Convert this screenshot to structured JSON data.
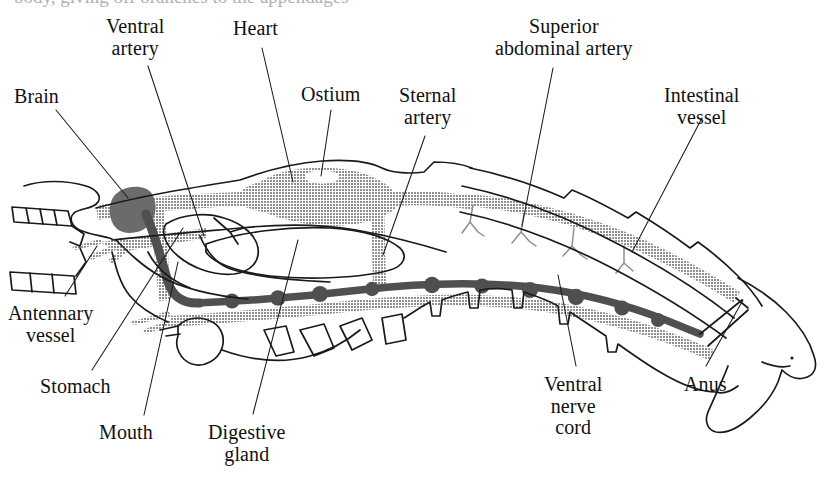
{
  "figure": {
    "top_cropped_text": "body, giving off branches to the appendages",
    "colors": {
      "outline": "#1a1a1a",
      "artery_gray": "#999999",
      "nerve_dark": "#555555",
      "brain_dark": "#6b6b6b",
      "background": "#ffffff",
      "label_text": "#111111"
    }
  },
  "labels": [
    {
      "id": "brain",
      "text": "Brain",
      "lines": [
        "Brain"
      ],
      "x": 14,
      "y": 86,
      "align": "left"
    },
    {
      "id": "ventral-artery",
      "text": "Ventral artery",
      "lines": [
        "Ventral",
        "artery"
      ],
      "x": 106,
      "y": 16,
      "align": "center"
    },
    {
      "id": "heart",
      "text": "Heart",
      "lines": [
        "Heart"
      ],
      "x": 233,
      "y": 18,
      "align": "center"
    },
    {
      "id": "ostium",
      "text": "Ostium",
      "lines": [
        "Ostium"
      ],
      "x": 301,
      "y": 84,
      "align": "center"
    },
    {
      "id": "sternal-artery",
      "text": "Sternal artery",
      "lines": [
        "Sternal",
        "artery"
      ],
      "x": 399,
      "y": 85,
      "align": "center"
    },
    {
      "id": "superior-abdominal-artery",
      "text": "Superior abdominal artery",
      "lines": [
        "Superior",
        "abdominal artery"
      ],
      "x": 495,
      "y": 16,
      "align": "center"
    },
    {
      "id": "intestinal-vessel",
      "text": "Intestinal vessel",
      "lines": [
        "Intestinal",
        "vessel"
      ],
      "x": 664,
      "y": 85,
      "align": "center"
    },
    {
      "id": "antennary-vessel",
      "text": "Antennary vessel",
      "lines": [
        "Antennary",
        "vessel"
      ],
      "x": 8,
      "y": 303,
      "align": "center"
    },
    {
      "id": "stomach",
      "text": "Stomach",
      "lines": [
        "Stomach"
      ],
      "x": 40,
      "y": 376,
      "align": "left"
    },
    {
      "id": "mouth",
      "text": "Mouth",
      "lines": [
        "Mouth"
      ],
      "x": 99,
      "y": 422,
      "align": "left"
    },
    {
      "id": "digestive-gland",
      "text": "Digestive gland",
      "lines": [
        "Digestive",
        "gland"
      ],
      "x": 208,
      "y": 422,
      "align": "center"
    },
    {
      "id": "ventral-nerve-cord",
      "text": "Ventral nerve cord",
      "lines": [
        "Ventral",
        "nerve",
        "cord"
      ],
      "x": 544,
      "y": 374,
      "align": "center"
    },
    {
      "id": "anus",
      "text": "Anus",
      "lines": [
        "Anus"
      ],
      "x": 684,
      "y": 374,
      "align": "left"
    }
  ],
  "leader_lines": [
    {
      "id": "brain",
      "x1": 56,
      "y1": 110,
      "x2": 128,
      "y2": 198
    },
    {
      "id": "ventral-artery",
      "x1": 148,
      "y1": 66,
      "x2": 204,
      "y2": 236
    },
    {
      "id": "heart",
      "x1": 262,
      "y1": 48,
      "x2": 293,
      "y2": 182
    },
    {
      "id": "ostium",
      "x1": 331,
      "y1": 110,
      "x2": 321,
      "y2": 176
    },
    {
      "id": "sternal-artery",
      "x1": 425,
      "y1": 136,
      "x2": 383,
      "y2": 255
    },
    {
      "id": "superior-abdominal-artery",
      "x1": 553,
      "y1": 68,
      "x2": 522,
      "y2": 226
    },
    {
      "id": "intestinal-vessel",
      "x1": 702,
      "y1": 118,
      "x2": 632,
      "y2": 252
    },
    {
      "id": "antennary-vessel",
      "x1": 65,
      "y1": 296,
      "x2": 97,
      "y2": 246
    },
    {
      "id": "stomach",
      "x1": 92,
      "y1": 370,
      "x2": 183,
      "y2": 228
    },
    {
      "id": "mouth",
      "x1": 144,
      "y1": 415,
      "x2": 178,
      "y2": 262
    },
    {
      "id": "digestive-gland",
      "x1": 253,
      "y1": 414,
      "x2": 298,
      "y2": 240
    },
    {
      "id": "ventral-nerve-cord",
      "x1": 576,
      "y1": 366,
      "x2": 558,
      "y2": 275
    },
    {
      "id": "anus",
      "x1": 706,
      "y1": 366,
      "x2": 743,
      "y2": 300
    }
  ],
  "structures": [
    {
      "id": "body-outline",
      "name": "Body outline",
      "style": "stroke"
    },
    {
      "id": "carapace",
      "name": "Carapace",
      "style": "stroke"
    },
    {
      "id": "antenna-upper",
      "name": "Upper antenna",
      "style": "stroke"
    },
    {
      "id": "antenna-lower",
      "name": "Lower antenna",
      "style": "stroke"
    },
    {
      "id": "rostrum",
      "name": "Rostrum",
      "style": "stroke"
    },
    {
      "id": "brain",
      "name": "Brain",
      "style": "fill-dark"
    },
    {
      "id": "circumesophageal-connective",
      "name": "Circumesophageal connective",
      "style": "fill-dark"
    },
    {
      "id": "ventral-artery",
      "name": "Ventral artery",
      "style": "fill-gray"
    },
    {
      "id": "antennary-vessel",
      "name": "Antennary vessel",
      "style": "fill-gray"
    },
    {
      "id": "dorsal-abdominal-artery",
      "name": "Dorsal artery / heart line",
      "style": "fill-gray"
    },
    {
      "id": "heart",
      "name": "Heart",
      "style": "fill-gray"
    },
    {
      "id": "ostium",
      "name": "Ostium",
      "style": "fill-white"
    },
    {
      "id": "sternal-artery",
      "name": "Sternal artery",
      "style": "fill-gray"
    },
    {
      "id": "superior-abdominal-artery",
      "name": "Superior abdominal artery",
      "style": "fill-gray"
    },
    {
      "id": "intestinal-vessel",
      "name": "Intestinal vessel",
      "style": "fill-gray"
    },
    {
      "id": "ventral-nerve-cord",
      "name": "Ventral nerve cord",
      "style": "fill-nerve"
    },
    {
      "id": "stomach",
      "name": "Stomach",
      "style": "stroke"
    },
    {
      "id": "digestive-gland",
      "name": "Digestive gland",
      "style": "stroke"
    },
    {
      "id": "mouth",
      "name": "Mouth",
      "style": "stroke"
    },
    {
      "id": "walking-legs",
      "name": "Walking legs / pleopods",
      "style": "stroke"
    },
    {
      "id": "telson",
      "name": "Telson and uropods",
      "style": "stroke"
    },
    {
      "id": "anus",
      "name": "Anus",
      "style": "stroke"
    }
  ]
}
